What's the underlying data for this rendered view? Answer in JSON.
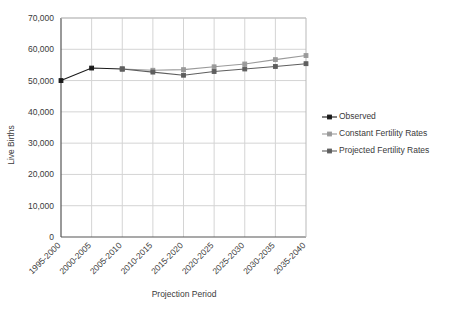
{
  "chart_data": {
    "type": "line",
    "title": "",
    "xlabel": "Projection Period",
    "ylabel": "Live Births",
    "categories": [
      "1995-2000",
      "2000-2005",
      "2005-2010",
      "2010-2015",
      "2015-2020",
      "2020-2025",
      "2025-2030",
      "2030-2035",
      "2035-2040"
    ],
    "ylim": [
      0,
      70000
    ],
    "ytick_step": 10000,
    "yticks": [
      0,
      10000,
      20000,
      30000,
      40000,
      50000,
      60000,
      70000
    ],
    "ytick_labels": [
      "0",
      "10,000",
      "20,000",
      "30,000",
      "40,000",
      "50,000",
      "60,000",
      "70,000"
    ],
    "grid": true,
    "legend_position": "right",
    "series": [
      {
        "name": "Observed",
        "color": "#1a1a1a",
        "values": [
          50000,
          54000,
          53700,
          null,
          null,
          null,
          null,
          null,
          null
        ]
      },
      {
        "name": "Constant Fertility Rates",
        "color": "#9a9a9a",
        "values": [
          null,
          null,
          53700,
          53300,
          53500,
          54400,
          55300,
          56700,
          58000
        ]
      },
      {
        "name": "Projected Fertility Rates",
        "color": "#5e5e5e",
        "values": [
          null,
          null,
          53700,
          52700,
          51700,
          52900,
          53700,
          54500,
          55400
        ]
      }
    ]
  },
  "legend": {
    "items": [
      {
        "label": "Observed"
      },
      {
        "label": "Constant Fertility Rates"
      },
      {
        "label": "Projected Fertility Rates"
      }
    ]
  }
}
